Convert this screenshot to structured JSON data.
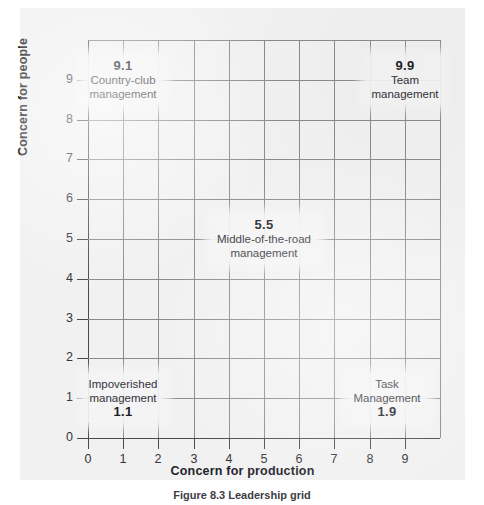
{
  "figure": {
    "caption": "Figure 8.3 Leadership grid"
  },
  "chart_data": {
    "type": "scatter",
    "title": "",
    "xlabel": "Concern for production",
    "ylabel": "Concern for people",
    "xlim": [
      0,
      10
    ],
    "ylim": [
      0,
      10
    ],
    "grid": true,
    "legend": "none",
    "xticks": [
      "0",
      "1",
      "2",
      "3",
      "4",
      "5",
      "6",
      "7",
      "8",
      "9"
    ],
    "yticks": [
      "0",
      "1",
      "2",
      "3",
      "4",
      "5",
      "6",
      "7",
      "8",
      "9"
    ],
    "points": [
      {
        "code": "9.1",
        "name_line1": "Country-club",
        "name_line2": "management",
        "x": 1,
        "y": 9,
        "code_position": "above"
      },
      {
        "code": "9.9",
        "name_line1": "Team",
        "name_line2": "management",
        "x": 9,
        "y": 9,
        "code_position": "above"
      },
      {
        "code": "5.5",
        "name_line1": "Middle-of-the-road",
        "name_line2": "management",
        "x": 5,
        "y": 5,
        "code_position": "above"
      },
      {
        "code": "1.1",
        "name_line1": "Impoverished",
        "name_line2": "management",
        "x": 1,
        "y": 1,
        "code_position": "below"
      },
      {
        "code": "1.9",
        "name_line1": "Task",
        "name_line2": "Management",
        "x": 8.5,
        "y": 1,
        "code_position": "below"
      }
    ]
  }
}
